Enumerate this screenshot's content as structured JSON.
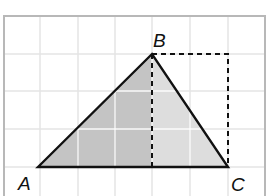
{
  "diagram": {
    "title": "",
    "grid": {
      "x0": 4,
      "y0": 16,
      "x1": 265,
      "y1": 196,
      "vlines": [
        40,
        78,
        115,
        152,
        190,
        228
      ],
      "hlines": [
        54,
        91,
        129,
        167
      ],
      "line_color": "#e4e4e4",
      "border_color": "#b8b8b8"
    },
    "points": {
      "A": {
        "label": "A",
        "x": 38,
        "y": 167,
        "label_x": 18,
        "label_y": 190
      },
      "B": {
        "label": "B",
        "x": 152,
        "y": 54,
        "label_x": 153,
        "label_y": 47
      },
      "C": {
        "label": "C",
        "x": 228,
        "y": 167,
        "label_x": 231,
        "label_y": 191
      }
    },
    "shading": {
      "left_fill": "#c4c4c4",
      "right_fill": "#dddddd"
    },
    "dashed": {
      "rect_corner_x": 228,
      "rect_corner_y": 54,
      "altitude_foot_x": 152,
      "altitude_foot_y": 167,
      "color": "#111111"
    },
    "stroke_color": "#111111"
  }
}
